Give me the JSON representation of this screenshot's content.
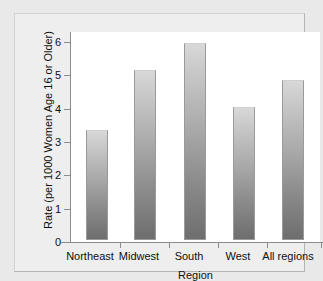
{
  "chart_data": {
    "type": "bar",
    "title": "",
    "subtitle": "",
    "xlabel": "Region",
    "ylabel": "Rate (per 1000 Women Age 16 or Older)",
    "categories": [
      "Northeast",
      "Midwest",
      "South",
      "West",
      "All regions"
    ],
    "values": [
      3.3,
      5.1,
      5.9,
      4.0,
      4.8
    ],
    "ylim": [
      0,
      6
    ],
    "ytick_labels": [
      "0",
      "1",
      "2",
      "3",
      "4",
      "5",
      "6"
    ],
    "ytick_values": [
      0,
      1,
      2,
      3,
      4,
      5,
      6
    ],
    "grid": false,
    "legend": null,
    "legend_position": "none",
    "annotations": [],
    "bar_fill": "vertical gradient light gray to dark gray",
    "bar_color_top": "#d8d8d8",
    "bar_color_bottom": "#6e6e6e",
    "bar_border_color": "#9a9a9a",
    "plot_background": "#ffffff",
    "figure_background": "#e9e9e9",
    "axis_color": "#8c8c8c",
    "text_color": "#101010"
  }
}
